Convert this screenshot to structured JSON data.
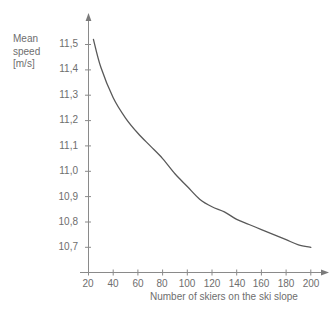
{
  "chart_data": {
    "type": "line",
    "title": "",
    "xlabel": "Number of skiers on the ski slope",
    "ylabel": "Mean\nspeed\n[m/s]",
    "ylabel_lines": [
      "Mean",
      "speed",
      "[m/s]"
    ],
    "xlim": [
      20,
      205
    ],
    "ylim": [
      10.62,
      11.56
    ],
    "grid": false,
    "legend": null,
    "line_color": "#595959",
    "axis_color": "#8a8a8a",
    "text_color": "#6e6e6e",
    "xticks": [
      20,
      40,
      60,
      80,
      100,
      120,
      140,
      160,
      180,
      200
    ],
    "xtick_labels": [
      "20",
      "40",
      "60",
      "80",
      "100",
      "120",
      "140",
      "160",
      "180",
      "200"
    ],
    "yticks": [
      10.7,
      10.8,
      10.9,
      11.0,
      11.1,
      11.2,
      11.3,
      11.4,
      11.5
    ],
    "ytick_labels": [
      "10,7",
      "10,8",
      "10,9",
      "11,0",
      "11,1",
      "11,2",
      "11,3",
      "11,4",
      "11,5"
    ],
    "x": [
      24,
      30,
      40,
      50,
      60,
      70,
      80,
      90,
      100,
      110,
      120,
      130,
      140,
      150,
      160,
      170,
      180,
      190,
      200
    ],
    "values": [
      11.52,
      11.41,
      11.29,
      11.21,
      11.15,
      11.1,
      11.05,
      10.99,
      10.94,
      10.89,
      10.86,
      10.84,
      10.81,
      10.79,
      10.77,
      10.75,
      10.73,
      10.71,
      10.7
    ],
    "series": [
      {
        "name": "Mean speed",
        "values": [
          11.52,
          11.41,
          11.29,
          11.21,
          11.15,
          11.1,
          11.05,
          10.99,
          10.94,
          10.89,
          10.86,
          10.84,
          10.81,
          10.79,
          10.77,
          10.75,
          10.73,
          10.71,
          10.7
        ]
      }
    ]
  },
  "axes": {
    "y_title_line1": "Mean",
    "y_title_line2": "speed",
    "y_title_line3": "[m/s]",
    "x_title": "Number of skiers on the ski slope"
  },
  "y_tick_labels": [
    "11,5",
    "11,4",
    "11,3",
    "11,2",
    "11,1",
    "11,0",
    "10,9",
    "10,8",
    "10,7"
  ],
  "x_tick_labels": [
    "20",
    "40",
    "60",
    "80",
    "100",
    "120",
    "140",
    "160",
    "180",
    "200"
  ]
}
